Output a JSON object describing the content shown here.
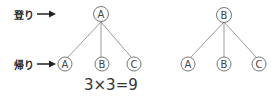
{
  "labels": {
    "up": "登り",
    "return": "帰り"
  },
  "equation": "3×3=9",
  "trees": [
    {
      "root": "A",
      "children": [
        "A",
        "B",
        "C"
      ]
    },
    {
      "root": "B",
      "children": [
        "A",
        "B",
        "C"
      ]
    }
  ],
  "colors": {
    "line": "#9a9a9a",
    "circle": "#666666",
    "text": "#333333"
  }
}
